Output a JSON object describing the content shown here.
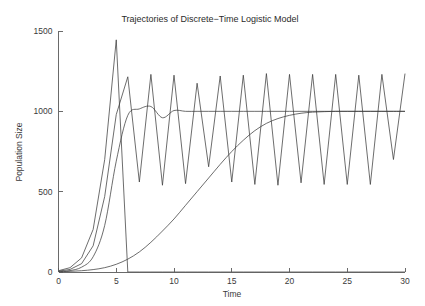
{
  "chart_data": {
    "type": "line",
    "title": "Trajectories of Discrete−Time Logistic Model",
    "xlabel": "Time",
    "ylabel": "Population Size",
    "xlim": [
      0,
      30
    ],
    "ylim": [
      0,
      1500
    ],
    "xticks": [
      0,
      5,
      10,
      15,
      20,
      25,
      30
    ],
    "xtick_labels": [
      "0",
      "5",
      "10",
      "15",
      "20",
      "25",
      "30"
    ],
    "yticks": [
      0,
      500,
      1000,
      1500
    ],
    "ytick_labels": [
      "0",
      "500",
      "1000",
      "1500"
    ],
    "grid": false,
    "legend": "none",
    "line_color": "#3c3c3c",
    "axis_color": "#5a5a5a",
    "background": "#ffffff",
    "x": [
      0,
      1,
      2,
      3,
      4,
      5,
      6,
      7,
      8,
      9,
      10,
      11,
      12,
      13,
      14,
      15,
      16,
      17,
      18,
      19,
      20,
      21,
      22,
      23,
      24,
      25,
      26,
      27,
      28,
      29,
      30
    ],
    "series": [
      {
        "name": "crash-trajectory",
        "note": "overshoots to ~1445 at t=5 then collapses to 0 at t=6",
        "values": [
          8,
          27,
          88,
          265,
          700,
          1445,
          0,
          0,
          0,
          0,
          0,
          0,
          0,
          0,
          0,
          0,
          0,
          0,
          0,
          0,
          0,
          0,
          0,
          0,
          0,
          0,
          0,
          0,
          0,
          0,
          0
        ]
      },
      {
        "name": "two-cycle-trajectory",
        "note": "settles into a period-2 oscillation between ~1230 and ~545",
        "values": [
          5,
          16,
          52,
          163,
          470,
          980,
          1215,
          560,
          1230,
          540,
          1225,
          550,
          1175,
          655,
          1220,
          560,
          1225,
          545,
          1235,
          540,
          1230,
          555,
          1230,
          545,
          1230,
          545,
          1225,
          545,
          1230,
          700,
          1235
        ]
      },
      {
        "name": "damped-oscillation-trajectory",
        "note": "overshoots slightly near t=8 then damps to carrying capacity 1000",
        "values": [
          3,
          9,
          30,
          95,
          290,
          690,
          975,
          1015,
          1030,
          960,
          1005,
          1000,
          1000,
          1000,
          1000,
          1000,
          1000,
          1000,
          1000,
          1000,
          1000,
          1000,
          1000,
          1000,
          1000,
          1000,
          1000,
          1000,
          1000,
          1000,
          1000
        ]
      },
      {
        "name": "slow-logistic-trajectory",
        "note": "slow monotone sigmoid approaching 1000 near t=22",
        "values": [
          2,
          4,
          8,
          15,
          27,
          48,
          80,
          125,
          185,
          255,
          330,
          415,
          500,
          585,
          670,
          750,
          820,
          880,
          925,
          955,
          975,
          988,
          995,
          998,
          1000,
          1000,
          1000,
          1000,
          1000,
          1000,
          1000
        ]
      }
    ]
  }
}
